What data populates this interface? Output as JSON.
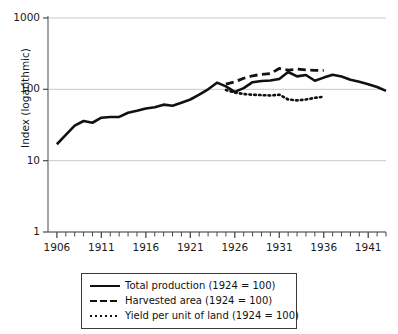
{
  "chart_data": {
    "type": "line",
    "title": "",
    "xlabel": "",
    "ylabel": "Index (logarithmic)",
    "yscale": "log",
    "ylim": [
      1,
      1000
    ],
    "xlim": [
      1905,
      1943
    ],
    "grid": true,
    "legend_position": "below-axes",
    "y_ticks": [
      "1",
      "10",
      "100",
      "1000"
    ],
    "y_tick_values": [
      1,
      10,
      100,
      1000
    ],
    "x_ticks": [
      "1906",
      "1911",
      "1916",
      "1921",
      "1926",
      "1931",
      "1936",
      "1941"
    ],
    "x_tick_values": [
      1906,
      1911,
      1916,
      1921,
      1926,
      1931,
      1936,
      1941
    ],
    "x_minor_tick_step": 1,
    "series": [
      {
        "name": "Total production (1924 = 100)",
        "style": "solid",
        "color": "#111111",
        "x": [
          1906,
          1907,
          1908,
          1909,
          1910,
          1911,
          1912,
          1913,
          1914,
          1915,
          1916,
          1917,
          1918,
          1919,
          1920,
          1921,
          1922,
          1923,
          1924,
          1925,
          1926,
          1927,
          1928,
          1929,
          1930,
          1931,
          1932,
          1933,
          1934,
          1935,
          1936,
          1937,
          1938,
          1939,
          1940,
          1941,
          1942,
          1943
        ],
        "values": [
          17,
          23,
          31,
          36,
          34,
          40,
          41,
          41,
          47,
          50,
          54,
          56,
          61,
          59,
          65,
          72,
          84,
          100,
          124,
          110,
          92,
          104,
          126,
          131,
          133,
          140,
          175,
          152,
          159,
          132,
          146,
          160,
          151,
          136,
          128,
          118,
          108,
          95
        ]
      },
      {
        "name": "Harvested area (1924 = 100)",
        "style": "dashed",
        "color": "#111111",
        "x": [
          1925,
          1926,
          1927,
          1928,
          1929,
          1930,
          1931,
          1932,
          1933,
          1934,
          1935,
          1936
        ],
        "values": [
          118,
          127,
          143,
          155,
          162,
          166,
          196,
          186,
          192,
          187,
          185,
          185
        ]
      },
      {
        "name": "Yield per unit of land (1924 = 100)",
        "style": "dotted",
        "color": "#111111",
        "x": [
          1925,
          1926,
          1927,
          1928,
          1929,
          1930,
          1931,
          1932,
          1933,
          1934,
          1935,
          1936
        ],
        "values": [
          98,
          90,
          86,
          84,
          83,
          82,
          84,
          72,
          70,
          72,
          76,
          79
        ]
      }
    ]
  },
  "legend": {
    "entries": [
      {
        "label": "Total production (1924 = 100)",
        "style": "solid"
      },
      {
        "label": "Harvested area (1924 = 100)",
        "style": "dashed"
      },
      {
        "label": "Yield per unit of land (1924 = 100)",
        "style": "dotted"
      }
    ]
  }
}
